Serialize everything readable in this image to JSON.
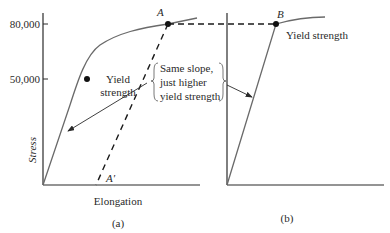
{
  "panel_a": {
    "y_ticks": [
      "80,000",
      "50,000"
    ],
    "y_label": "Stress",
    "x_label": "Elongation",
    "point_top": "A",
    "point_bottom": "A′",
    "yield_label_line1": "Yield",
    "yield_label_line2": "strength",
    "caption": "(a)"
  },
  "annotation": {
    "line1": "Same slope,",
    "line2": "just higher",
    "line3": "yield strength"
  },
  "panel_b": {
    "point": "B",
    "yield_label": "Yield strength",
    "caption": "(b)"
  },
  "colors": {
    "curve": "#6a6a6a",
    "axis": "#2a2a2a",
    "dash": "#1a1a1a"
  }
}
